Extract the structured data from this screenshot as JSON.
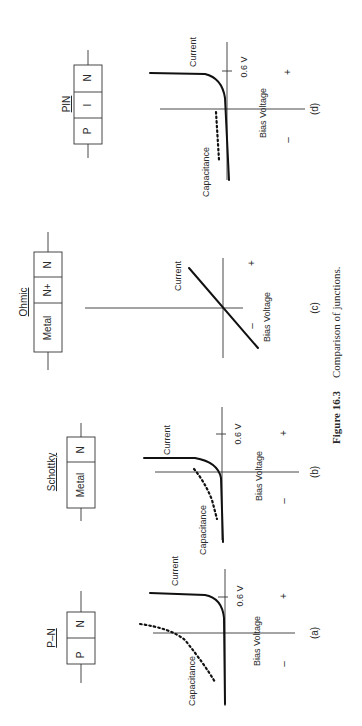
{
  "caption": {
    "number": "Figure 16.3",
    "text": "Comparison of junctions."
  },
  "panels": [
    {
      "id": "a",
      "title": "P–N",
      "label": "(a)",
      "regions": [
        "P",
        "N"
      ],
      "curves": [
        "Current",
        "Capacitance"
      ],
      "xlabel": "Bias Voltage",
      "knee_label": "0.6 V",
      "neg": "–",
      "pos": "+"
    },
    {
      "id": "b",
      "title": "Schottky",
      "label": "(b)",
      "regions": [
        "Metal",
        "N"
      ],
      "curves": [
        "Current",
        "Capacitance"
      ],
      "xlabel": "Bias Voltage",
      "knee_label": "0.6 V",
      "neg": "–",
      "pos": "+"
    },
    {
      "id": "c",
      "title": "Ohmic",
      "label": "(c)",
      "regions": [
        "Metal",
        "N+",
        "N"
      ],
      "curves": [
        "Current"
      ],
      "xlabel": "Bias Voltage",
      "neg": "–",
      "pos": "+"
    },
    {
      "id": "d",
      "title": "PIN",
      "label": "(d)",
      "regions": [
        "P",
        "I",
        "N"
      ],
      "curves": [
        "Current",
        "Capacitance"
      ],
      "xlabel": "Bias Voltage",
      "knee_label": "0.6 V",
      "neg": "–",
      "pos": "+"
    }
  ]
}
